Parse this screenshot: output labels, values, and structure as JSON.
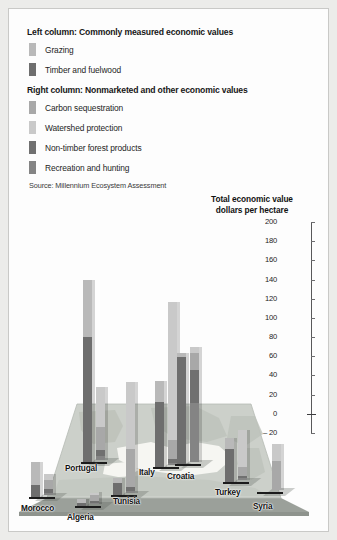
{
  "legend": {
    "sections": [
      {
        "header": "Left column: Commonly measured economic values",
        "items": [
          {
            "label": "Grazing",
            "color": "#b9b9b9",
            "key": "grazing"
          },
          {
            "label": "Timber and fuelwood",
            "color": "#6e6e6e",
            "key": "timber"
          }
        ]
      },
      {
        "header": "Right column: Nonmarketed and other economic values",
        "items": [
          {
            "label": "Carbon sequestration",
            "color": "#a8a8a8",
            "key": "carbon"
          },
          {
            "label": "Watershed protection",
            "color": "#c9c9c9",
            "key": "watershed"
          },
          {
            "label": "Non-timber forest products",
            "color": "#707070",
            "key": "nontimber"
          },
          {
            "label": "Recreation and hunting",
            "color": "#848484",
            "key": "recreation"
          }
        ]
      }
    ],
    "source": "Source: Millennium Ecosystem Assessment"
  },
  "axis_title_line1": "Total economic value",
  "axis_title_line2": "dollars per hectare",
  "chart_data": {
    "type": "bar",
    "subtitle": "dollars per hectare",
    "xlabel": "",
    "ylabel": "Total economic value dollars per hectare",
    "ylim": [
      -20,
      200
    ],
    "ytick_labels": [
      "200",
      "180",
      "160",
      "140",
      "120",
      "100",
      "80",
      "60",
      "40",
      "20",
      "0",
      "– 20"
    ],
    "ytick_values": [
      200,
      180,
      160,
      140,
      120,
      100,
      80,
      60,
      40,
      20,
      0,
      -20
    ],
    "grid": false,
    "legend_position": "top-left",
    "stacked": true,
    "categories": [
      "Morocco",
      "Algeria",
      "Tunisia",
      "Portugal",
      "Italy",
      "Croatia",
      "Turkey",
      "Syria"
    ],
    "columns": [
      {
        "name": "Commonly measured economic values",
        "series": [
          {
            "name": "Grazing",
            "color": "#b9b9b9",
            "values": [
              24,
              4,
              6,
              60,
              22,
              4,
              12,
              0
            ]
          },
          {
            "name": "Timber and fuelwood",
            "color": "#6e6e6e",
            "values": [
              12,
              3,
              12,
              130,
              68,
              112,
              34,
              0
            ]
          }
        ]
      },
      {
        "name": "Nonmarketed and other economic values",
        "series": [
          {
            "name": "Carbon sequestration",
            "color": "#a8a8a8",
            "values": [
              10,
              6,
              40,
              24,
              20,
              18,
              10,
              30
            ]
          },
          {
            "name": "Watershed protection",
            "color": "#c9c9c9",
            "values": [
              6,
              3,
              70,
              42,
              144,
              6,
              38,
              18
            ]
          },
          {
            "name": "Non-timber forest products",
            "color": "#707070",
            "values": [
              4,
              2,
              4,
              6,
              4,
              34,
              2,
              0
            ]
          },
          {
            "name": "Recreation and hunting",
            "color": "#848484",
            "values": [
              2,
              1,
              2,
              4,
              2,
              62,
              2,
              0
            ]
          }
        ]
      }
    ],
    "group_totals_left": [
      36,
      7,
      18,
      190,
      90,
      116,
      46,
      0
    ],
    "group_totals_right": [
      22,
      12,
      116,
      76,
      170,
      120,
      52,
      48
    ]
  },
  "map": {
    "name": "mediterranean-basin",
    "plane_color": "#cfd3cd",
    "land_color": "#b9beb6",
    "sea_color": "#f4f4f0"
  }
}
